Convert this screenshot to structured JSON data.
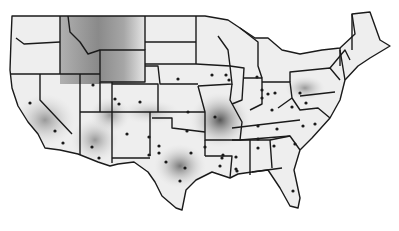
{
  "map": {
    "type": "choropleth-grayscale",
    "region": "Contiguous United States",
    "title_visible": false,
    "colors": {
      "background": "#ffffff",
      "border": "#1a1a1a",
      "light": "#f2f2f2",
      "mid": "#bdbdbd",
      "dark": "#6e6e6e"
    },
    "hotspots": [
      {
        "name": "northern-rockies",
        "intensity": "medium-dark"
      },
      {
        "name": "arkansas-missouri",
        "intensity": "dark"
      },
      {
        "name": "central-texas",
        "intensity": "medium-dark"
      },
      {
        "name": "southern-california",
        "intensity": "medium"
      },
      {
        "name": "arizona",
        "intensity": "medium"
      },
      {
        "name": "pennsylvania",
        "intensity": "medium"
      }
    ],
    "station_dot_count": 50
  }
}
